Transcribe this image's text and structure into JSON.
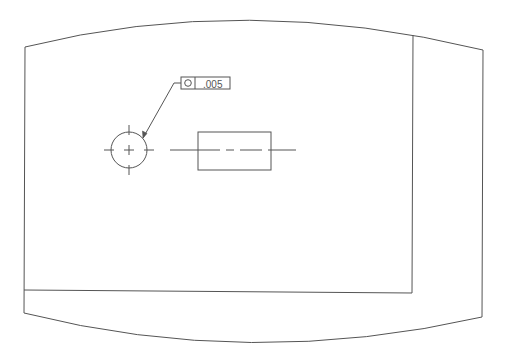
{
  "drawing": {
    "sheet_outline": "curved-screen-border",
    "feature_control_frame": {
      "symbol": "○",
      "symbol_name": "circularity",
      "tolerance": ".005"
    },
    "colors": {
      "line": "#555555",
      "background": "#ffffff"
    }
  }
}
